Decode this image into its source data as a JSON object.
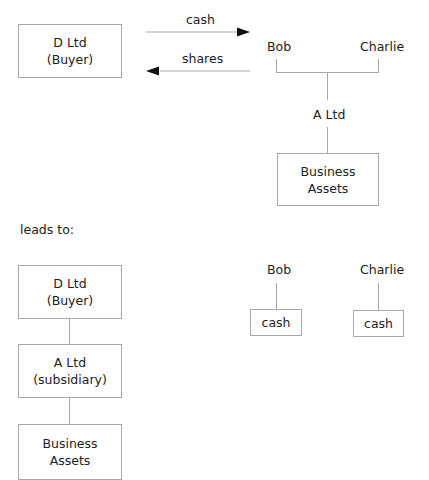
{
  "before": {
    "buyer_box": {
      "line1": "D Ltd",
      "line2": "(Buyer)"
    },
    "arrow_right_label": "cash",
    "arrow_left_label": "shares",
    "shareholders": [
      "Bob",
      "Charlie"
    ],
    "company_label": "A Ltd",
    "assets_box": {
      "line1": "Business",
      "line2": "Assets"
    }
  },
  "transition_label": "leads to:",
  "after": {
    "buyer_box": {
      "line1": "D Ltd",
      "line2": "(Buyer)"
    },
    "subsidiary_box": {
      "line1": "A Ltd",
      "line2": "(subsidiary)"
    },
    "assets_box": {
      "line1": "Business",
      "line2": "Assets"
    },
    "shareholders": [
      {
        "name": "Bob",
        "holding": "cash"
      },
      {
        "name": "Charlie",
        "holding": "cash"
      }
    ]
  },
  "colors": {
    "line": "#a8a8a8",
    "arrow": "#111111",
    "text": "#222222"
  }
}
